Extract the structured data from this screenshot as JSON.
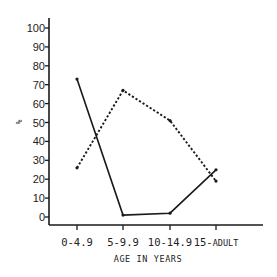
{
  "chart_data": {
    "type": "line",
    "title": "",
    "xlabel": "AGE IN YEARS",
    "ylabel": "%",
    "categories": [
      "0-4.9",
      "5-9.9",
      "10-14.9",
      "15-ADULT"
    ],
    "series": [
      {
        "name": "solid",
        "style": "solid",
        "values": [
          73,
          1,
          2,
          25
        ]
      },
      {
        "name": "dashed",
        "style": "dotted",
        "values": [
          26,
          67,
          51,
          19
        ]
      }
    ],
    "ylim": [
      0,
      100
    ],
    "yticks": [
      0,
      10,
      20,
      30,
      40,
      50,
      60,
      70,
      80,
      90,
      100
    ],
    "grid": false,
    "legend": "none"
  },
  "colors": {
    "line": "#1a1a1a",
    "background": "#ffffff"
  }
}
